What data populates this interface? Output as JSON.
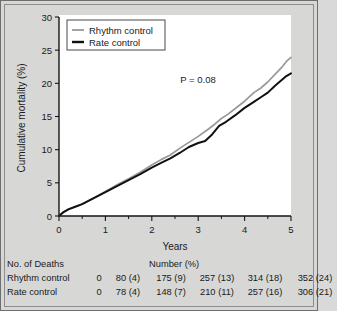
{
  "chart_data": {
    "type": "line",
    "title": "",
    "xlabel": "Years",
    "ylabel": "Cumulative mortality (%)",
    "xlim": [
      0,
      5
    ],
    "ylim": [
      0,
      30
    ],
    "xticks": [
      "0",
      "1",
      "2",
      "3",
      "4",
      "5"
    ],
    "yticks": [
      "0",
      "5",
      "10",
      "15",
      "20",
      "25",
      "30"
    ],
    "xtick_minor_step": 0.5,
    "grid": false,
    "legend_position": "top-left",
    "annotation": "P = 0.08",
    "series": [
      {
        "name": "Rhythm control",
        "color": "#999999",
        "x": [
          0,
          0.08,
          0.2,
          0.35,
          0.5,
          0.75,
          1.0,
          1.25,
          1.5,
          1.75,
          2.0,
          2.2,
          2.4,
          2.6,
          2.8,
          3.0,
          3.2,
          3.35,
          3.5,
          3.65,
          3.8,
          4.0,
          4.2,
          4.35,
          4.5,
          4.65,
          4.8,
          4.9,
          5.0
        ],
        "y": [
          0,
          0.5,
          1.0,
          1.4,
          1.8,
          2.7,
          3.7,
          4.7,
          5.6,
          6.6,
          7.7,
          8.5,
          9.2,
          10.2,
          11.1,
          12.0,
          13.0,
          13.8,
          14.7,
          15.4,
          16.2,
          17.3,
          18.6,
          19.3,
          20.2,
          21.3,
          22.4,
          23.3,
          23.9
        ]
      },
      {
        "name": "Rate control",
        "color": "#111111",
        "x": [
          0,
          0.08,
          0.2,
          0.35,
          0.5,
          0.75,
          1.0,
          1.25,
          1.5,
          1.75,
          2.0,
          2.2,
          2.4,
          2.6,
          2.8,
          3.0,
          3.15,
          3.3,
          3.45,
          3.6,
          3.8,
          4.0,
          4.2,
          4.35,
          4.5,
          4.65,
          4.8,
          4.9,
          5.0
        ],
        "y": [
          0,
          0.5,
          1.0,
          1.4,
          1.8,
          2.7,
          3.6,
          4.5,
          5.4,
          6.3,
          7.3,
          8.0,
          8.7,
          9.5,
          10.4,
          11.0,
          11.3,
          12.3,
          13.6,
          14.2,
          15.2,
          16.3,
          17.2,
          17.9,
          18.6,
          19.6,
          20.5,
          21.1,
          21.5
        ]
      }
    ]
  },
  "legend": {
    "items": [
      {
        "label": "Rhythm control",
        "color": "#999999"
      },
      {
        "label": "Rate control",
        "color": "#111111"
      }
    ]
  },
  "table": {
    "title": "No. of Deaths",
    "subtitle": "Number (%)",
    "rows": [
      {
        "label": "Rhythm control",
        "values": [
          "0",
          "80 (4)",
          "175 (9)",
          "257 (13)",
          "314 (18)",
          "352 (24)"
        ]
      },
      {
        "label": "Rate control",
        "values": [
          "0",
          "78 (4)",
          "148 (7)",
          "210 (11)",
          "257 (16)",
          "306 (21)"
        ]
      }
    ]
  }
}
